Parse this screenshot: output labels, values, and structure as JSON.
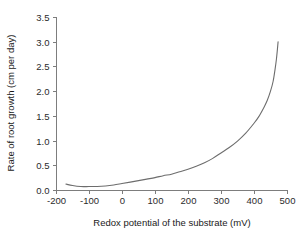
{
  "chart_data": {
    "type": "line",
    "title": "",
    "subtitle": "",
    "xlabel": "Redox potential of the substrate (mV)",
    "ylabel": "Rate of root growth (cm per day)",
    "xlim": [
      -200,
      500
    ],
    "ylim": [
      0.0,
      3.5
    ],
    "xticks": [
      -200,
      -100,
      0,
      100,
      200,
      300,
      400,
      500
    ],
    "xtick_labels": [
      "-200",
      "-100",
      "0",
      "100",
      "200",
      "300",
      "400",
      "500"
    ],
    "yticks": [
      0.0,
      0.5,
      1.0,
      1.5,
      2.0,
      2.5,
      3.0,
      3.5
    ],
    "ytick_labels": [
      "0.0",
      "0.5",
      "1.0",
      "1.5",
      "2.0",
      "2.5",
      "3.0",
      "3.5"
    ],
    "grid": false,
    "legend": null,
    "legend_position": "none",
    "annotations": [],
    "series": [
      {
        "name": "Rate of root growth",
        "color": "#6d6d6d",
        "x": [
          -170,
          -150,
          -125,
          -100,
          -75,
          -50,
          -25,
          0,
          25,
          50,
          75,
          100,
          125,
          150,
          175,
          200,
          225,
          250,
          275,
          300,
          325,
          350,
          375,
          400,
          415,
          430,
          440,
          450,
          458,
          464,
          468,
          471,
          473
        ],
        "y": [
          0.12,
          0.09,
          0.07,
          0.07,
          0.07,
          0.08,
          0.1,
          0.13,
          0.16,
          0.19,
          0.22,
          0.25,
          0.29,
          0.32,
          0.37,
          0.42,
          0.48,
          0.55,
          0.64,
          0.75,
          0.86,
          0.99,
          1.15,
          1.35,
          1.49,
          1.67,
          1.81,
          2.0,
          2.2,
          2.45,
          2.65,
          2.85,
          3.0
        ]
      }
    ]
  },
  "axes_geometry": {
    "x_px_min": 56,
    "x_px_max": 287,
    "y_px_min": 190,
    "y_px_max": 17
  },
  "colors": {
    "curve": "#6d6d6d",
    "axis": "#7d7d7d",
    "text": "#1a1a1a",
    "background": "#ffffff"
  }
}
